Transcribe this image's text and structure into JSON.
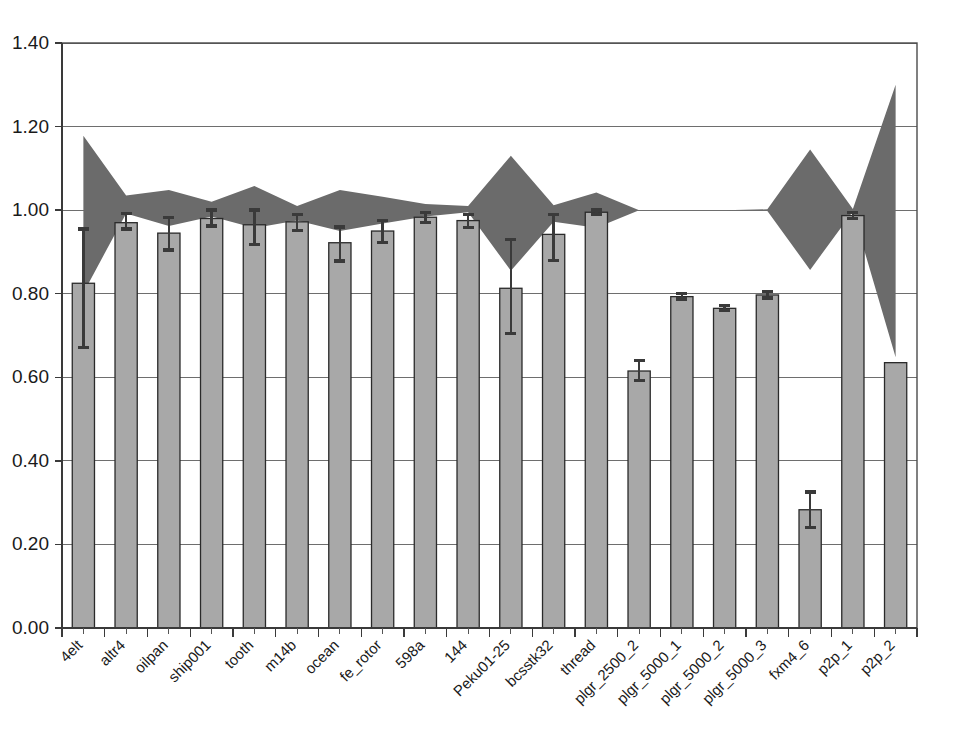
{
  "chart_data": {
    "type": "bar",
    "title": "",
    "xlabel": "",
    "ylabel": "",
    "ylim": [
      0.0,
      1.4
    ],
    "grid": true,
    "legend": "none",
    "y_ticks": [
      "0.00",
      "0.20",
      "0.40",
      "0.60",
      "0.80",
      "1.00",
      "1.20",
      "1.40"
    ],
    "y_tick_values": [
      0.0,
      0.2,
      0.4,
      0.6,
      0.8,
      1.0,
      1.2,
      1.4
    ],
    "categories": [
      "4elt",
      "altr4",
      "oilpan",
      "ship001",
      "tooth",
      "m14b",
      "ocean",
      "fe_rotor",
      "598a",
      "144",
      "Peku01-25",
      "bcsstk32",
      "thread",
      "plgr_2500_2",
      "plgr_5000_1",
      "plgr_5000_2",
      "plgr_5000_3",
      "fxm4_6",
      "p2p_1",
      "p2p_2"
    ],
    "series": [
      {
        "name": "bar_values",
        "type": "bar",
        "color": "#a8a8a8",
        "edge_color": "#2a2a2a",
        "values": [
          0.825,
          0.97,
          0.945,
          0.98,
          0.965,
          0.972,
          0.922,
          0.95,
          0.983,
          0.975,
          0.813,
          0.942,
          0.995,
          0.615,
          0.793,
          0.765,
          0.797,
          0.283,
          0.987,
          0.635
        ]
      },
      {
        "name": "error_bars",
        "type": "errorbar",
        "color": "#3a3a3a",
        "upper": [
          0.955,
          0.992,
          0.983,
          1.0,
          1.0,
          0.99,
          0.96,
          0.975,
          0.995,
          0.99,
          0.93,
          0.99,
          1.0,
          0.64,
          0.8,
          0.772,
          0.805,
          0.325,
          0.995,
          null
        ],
        "lower": [
          0.672,
          0.955,
          0.905,
          0.962,
          0.918,
          0.952,
          0.878,
          0.922,
          0.97,
          0.958,
          0.705,
          0.88,
          0.99,
          0.592,
          0.787,
          0.76,
          0.79,
          0.24,
          0.98,
          null
        ]
      },
      {
        "name": "band_upper",
        "type": "area_boundary",
        "color": "#6b6b6b",
        "values": [
          1.178,
          1.035,
          1.048,
          1.02,
          1.058,
          1.01,
          1.048,
          1.032,
          1.015,
          1.01,
          1.13,
          1.012,
          1.042,
          1.0,
          1.0,
          1.0,
          1.002,
          1.145,
          1.003,
          1.3
        ]
      },
      {
        "name": "band_lower",
        "type": "area_boundary",
        "color": "#6b6b6b",
        "values": [
          0.802,
          0.992,
          0.962,
          0.985,
          0.957,
          0.975,
          0.95,
          0.968,
          0.985,
          0.995,
          0.855,
          0.972,
          0.958,
          1.0,
          1.0,
          1.0,
          0.998,
          0.857,
          0.997,
          0.648
        ]
      }
    ]
  },
  "axes": {
    "x_label_rotation_deg": 45,
    "accent_band_color": "#6b6b6b",
    "bar_fill_color": "#a8a8a8",
    "grid_color": "#6e6e6e",
    "plot_bg": "#ffffff"
  }
}
